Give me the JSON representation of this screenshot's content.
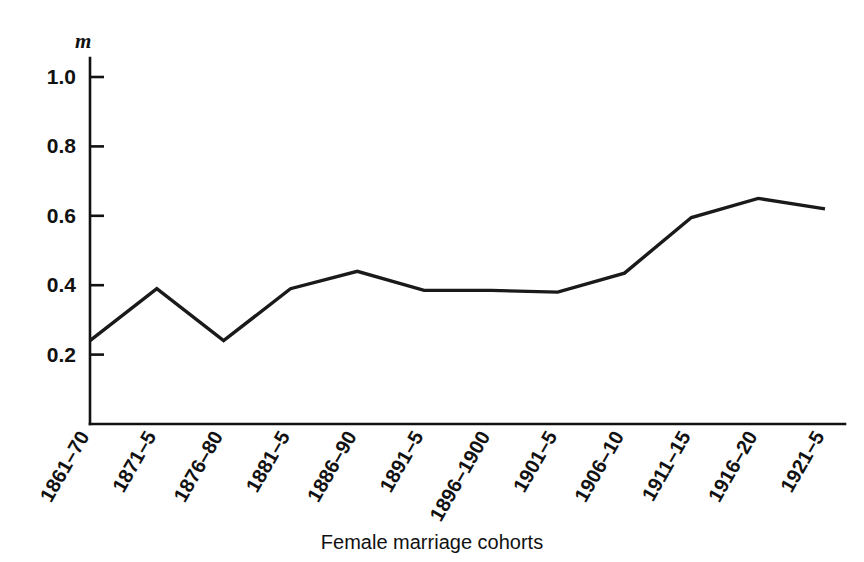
{
  "chart_data": {
    "type": "line",
    "title": "",
    "subtitle": "",
    "xlabel": "Female marriage cohorts",
    "ylabel": "m",
    "categories": [
      "1861–70",
      "1871–5",
      "1876–80",
      "1881–5",
      "1886–90",
      "1891–5",
      "1896–1900",
      "1901–5",
      "1906–10",
      "1911–15",
      "1916–20",
      "1921–5"
    ],
    "values": [
      0.24,
      0.39,
      0.24,
      0.39,
      0.44,
      0.385,
      0.385,
      0.38,
      0.435,
      0.595,
      0.65,
      0.62
    ],
    "series": [
      {
        "name": "m",
        "values": [
          0.24,
          0.39,
          0.24,
          0.39,
          0.44,
          0.385,
          0.385,
          0.38,
          0.435,
          0.595,
          0.65,
          0.62
        ]
      }
    ],
    "ylim": [
      0.0,
      1.08
    ],
    "ytick_labels": [
      "1.0",
      "0.8",
      "0.6",
      "0.4",
      "0.2"
    ],
    "ytick_values": [
      1.0,
      0.8,
      0.6,
      0.4,
      0.2
    ],
    "grid": false,
    "legend": "none",
    "line_color": "#1a1a1a",
    "axis_color": "#111111",
    "background_color": "#ffffff",
    "xtick_label_rotation": -60
  }
}
